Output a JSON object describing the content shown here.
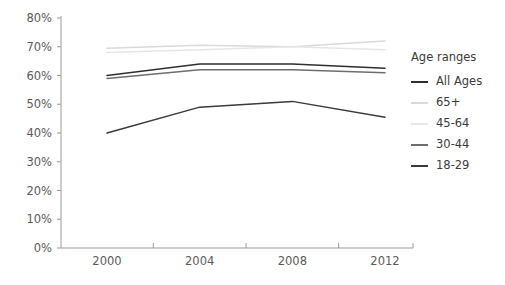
{
  "chart_data": {
    "type": "line",
    "title": "",
    "xlabel": "",
    "ylabel": "",
    "categories": [
      "2000",
      "2004",
      "2008",
      "2012"
    ],
    "x": [
      2000,
      2004,
      2008,
      2012
    ],
    "ylim": [
      0,
      80
    ],
    "y_ticks": [
      "0%",
      "10%",
      "20%",
      "30%",
      "40%",
      "50%",
      "60%",
      "70%",
      "80%"
    ],
    "y_tick_values": [
      0,
      10,
      20,
      30,
      40,
      50,
      60,
      70,
      80
    ],
    "x_ticks": [
      "2000",
      "2004",
      "2008",
      "2012"
    ],
    "grid": false,
    "legend_position": "right",
    "legend_title": "Age ranges",
    "series": [
      {
        "name": "All Ages",
        "color": "#2f2f2f",
        "values": [
          60,
          64,
          64,
          62.5
        ]
      },
      {
        "name": "65+",
        "color": "#dadada",
        "values": [
          69.5,
          70.5,
          70,
          72
        ]
      },
      {
        "name": "45-64",
        "color": "#e6e6e6",
        "values": [
          68,
          69,
          70,
          69
        ]
      },
      {
        "name": "30-44",
        "color": "#6e6e6e",
        "values": [
          59,
          62,
          62,
          61
        ]
      },
      {
        "name": "18-29",
        "color": "#3a3a3a",
        "values": [
          40,
          49,
          51,
          45.5
        ]
      }
    ]
  },
  "legend": {
    "title": "Age ranges",
    "items": [
      {
        "label": "All Ages",
        "color": "#2f2f2f"
      },
      {
        "label": "65+",
        "color": "#dadada"
      },
      {
        "label": "45-64",
        "color": "#e6e6e6"
      },
      {
        "label": "30-44",
        "color": "#6e6e6e"
      },
      {
        "label": "18-29",
        "color": "#3a3a3a"
      }
    ]
  },
  "axes": {
    "axis_color": "#9a9a9a",
    "tick_label_color": "#5a5a5a"
  }
}
